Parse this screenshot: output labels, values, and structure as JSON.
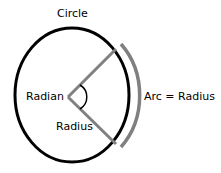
{
  "diagram": {
    "title": "Circle",
    "labels": {
      "circle": "Circle",
      "radian": "Radian",
      "radius": "Radius",
      "arc": "Arc = Radius"
    },
    "colors": {
      "circle": "#000000",
      "radius_lines": "#808080",
      "arc": "#808080",
      "angle_mark": "#000000"
    }
  }
}
